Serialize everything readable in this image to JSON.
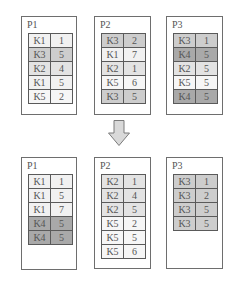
{
  "shades": {
    "K1": "#f1f1f1",
    "K2": "#e3e3e3",
    "K3": "#cdcdcd",
    "K4": "#a9a9a9",
    "K5": "#f6f6f6"
  },
  "before": {
    "partitions": [
      {
        "label": "P1",
        "rows": [
          [
            "K1",
            "1"
          ],
          [
            "K3",
            "5"
          ],
          [
            "K2",
            "4"
          ],
          [
            "K1",
            "5"
          ],
          [
            "K5",
            "2"
          ]
        ]
      },
      {
        "label": "P2",
        "rows": [
          [
            "K3",
            "2"
          ],
          [
            "K1",
            "7"
          ],
          [
            "K2",
            "1"
          ],
          [
            "K5",
            "6"
          ],
          [
            "K3",
            "5"
          ]
        ]
      },
      {
        "label": "P3",
        "rows": [
          [
            "K3",
            "1"
          ],
          [
            "K4",
            "5"
          ],
          [
            "K2",
            "5"
          ],
          [
            "K5",
            "5"
          ],
          [
            "K4",
            "5"
          ]
        ]
      }
    ]
  },
  "arrow": {
    "icon": "down-arrow-icon",
    "fill": "#d9d9d9",
    "stroke": "#7a7a7a"
  },
  "after": {
    "partitions": [
      {
        "label": "P1",
        "rows": [
          [
            "K1",
            "1"
          ],
          [
            "K1",
            "5"
          ],
          [
            "K1",
            "7"
          ],
          [
            "K4",
            "5"
          ],
          [
            "K4",
            "5"
          ]
        ]
      },
      {
        "label": "P2",
        "rows": [
          [
            "K2",
            "1"
          ],
          [
            "K2",
            "4"
          ],
          [
            "K2",
            "5"
          ],
          [
            "K5",
            "2"
          ],
          [
            "K5",
            "5"
          ],
          [
            "K5",
            "6"
          ]
        ]
      },
      {
        "label": "P3",
        "rows": [
          [
            "K3",
            "1"
          ],
          [
            "K3",
            "2"
          ],
          [
            "K3",
            "5"
          ],
          [
            "K3",
            "5"
          ]
        ]
      }
    ]
  }
}
